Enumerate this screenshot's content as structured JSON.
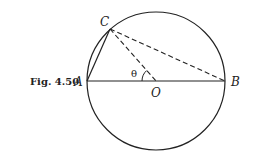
{
  "figure": {
    "caption": "Fig. 4.50",
    "points": {
      "A": "A",
      "B": "B",
      "C": "C",
      "O": "O"
    },
    "angle_label": "θ",
    "colors": {
      "stroke": "#222222",
      "background": "#ffffff"
    }
  }
}
